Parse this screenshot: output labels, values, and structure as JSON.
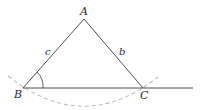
{
  "figure": {
    "type": "triangle-construction",
    "vertices": {
      "A": {
        "label": "A",
        "x": 84,
        "y": 19
      },
      "B": {
        "label": "B",
        "x": 23,
        "y": 88
      },
      "C": {
        "label": "C",
        "x": 143,
        "y": 88
      }
    },
    "sides": {
      "c": {
        "label": "c"
      },
      "b": {
        "label": "b"
      }
    },
    "baseline_end_x": 193,
    "angle_marker_at": "B",
    "arc_style": "dashed",
    "colors": {
      "line": "#3a3a3a",
      "arc": "#bdbdbd",
      "text": "#2a2a2a"
    }
  }
}
